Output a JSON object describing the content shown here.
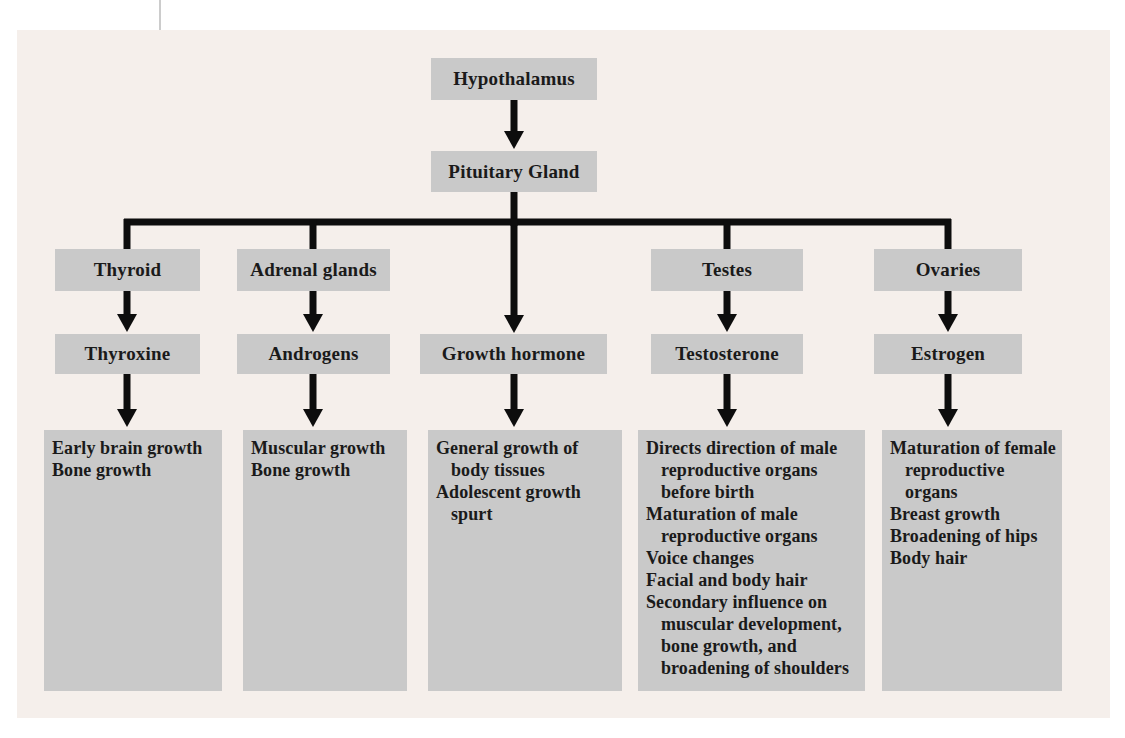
{
  "palette": {
    "page_background": "#ffffff",
    "panel_background": "#f5efeb",
    "node_background": "#c9c9c9",
    "text_color": "#1a1a1a",
    "connector_color": "#0d0d0d"
  },
  "flowchart": {
    "root": "Hypothalamus",
    "level2": "Pituitary Gland",
    "columns": [
      {
        "gland": "Thyroid",
        "hormone": "Thyroxine",
        "effects": [
          "Early brain growth",
          "Bone growth"
        ]
      },
      {
        "gland": "Adrenal glands",
        "hormone": "Androgens",
        "effects": [
          "Muscular growth",
          "Bone growth"
        ]
      },
      {
        "hormone": "Growth hormone",
        "effects": [
          "General growth of body tissues",
          "Adolescent growth spurt"
        ]
      },
      {
        "gland": "Testes",
        "hormone": "Testosterone",
        "effects": [
          "Directs direction of male reproductive organs before birth",
          "Maturation of male reproductive organs",
          "Voice changes",
          "Facial and body hair",
          "Secondary influence on muscular development, bone growth, and broadening of shoulders"
        ]
      },
      {
        "gland": "Ovaries",
        "hormone": "Estrogen",
        "effects": [
          "Maturation of female reproductive organs",
          "Breast growth",
          "Broadening of hips",
          "Body hair"
        ]
      }
    ]
  }
}
